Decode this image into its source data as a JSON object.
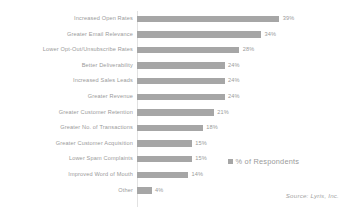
{
  "chart_data": {
    "type": "bar",
    "orientation": "horizontal",
    "title": "",
    "subtitle": "",
    "xlabel": "",
    "ylabel": "",
    "grid": false,
    "xlim": [
      0,
      40
    ],
    "legend_position": "right",
    "categories": [
      "Increased Open Rates",
      "Greater Email Relevance",
      "Lower Opt-Out/Unsubscribe Rates",
      "Better Deliverability",
      "Increased Sales Leads",
      "Greater Revenue",
      "Greater Customer Retention",
      "Greater No. of Transactions",
      "Greater Customer Acquisition",
      "Lower Spam Complaints",
      "Improved Word of Mouth",
      "Other"
    ],
    "values": [
      39,
      34,
      28,
      24,
      24,
      24,
      21,
      18,
      15,
      15,
      14,
      4
    ],
    "value_labels": [
      "39%",
      "34%",
      "28%",
      "24%",
      "24%",
      "24%",
      "21%",
      "18%",
      "15%",
      "15%",
      "14%",
      "4%"
    ],
    "series": [
      {
        "name": "% of Respondents",
        "values": [
          39,
          34,
          28,
          24,
          24,
          24,
          21,
          18,
          15,
          15,
          14,
          4
        ],
        "color": "#a6a6a6"
      }
    ],
    "legend": [
      "% of Respondents"
    ],
    "annotations": [
      "Source: Lyris, Inc."
    ]
  },
  "legend": {
    "label": "% of Respondents"
  },
  "source": {
    "text": "Source: Lyris, Inc."
  },
  "colors": {
    "bar": "#a6a6a6",
    "label_text": "#9a9a9a",
    "axis": "#e2e2e2",
    "background": "#ffffff"
  }
}
